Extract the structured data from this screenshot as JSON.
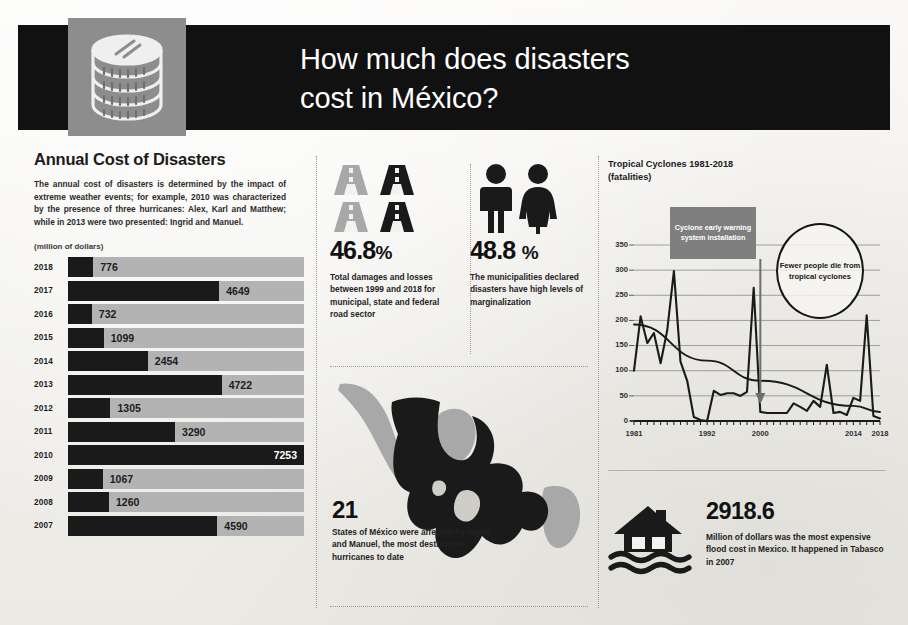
{
  "header": {
    "title_line1": "How much does disasters",
    "title_line2": "cost in México?",
    "icon": "coin-stack-icon"
  },
  "left": {
    "heading": "Annual Cost of Disasters",
    "body": "The annual cost of disasters is determined by the impact of extreme weather events; for example, 2010 was characterized by the presence of three hurricanes: Alex, Karl and Matthew; while in 2013 were two presented: Ingrid and Manuel.",
    "units": "(million of dollars)"
  },
  "middle": {
    "stat_roads": {
      "percent": "46.8",
      "symbol": "%",
      "description": "Total damages and losses between 1999 and 2018 for municipal, state and federal road sector",
      "icon": "road-icon"
    },
    "stat_people": {
      "percent": "48.8",
      "symbol": "%",
      "description": "The municipalities declared disasters have high levels of marginalization",
      "icon": "people-icon"
    },
    "map": {
      "number": "21",
      "description": "States of México were affected by Ingrid and Manuel, the most destructive hurricanes to date",
      "icon": "mexico-map-icon"
    }
  },
  "right": {
    "flood": {
      "number": "2918.6",
      "description": "Million of dollars was the most expensive flood cost in Mexico. It happened in Tabasco in 2007",
      "icon": "flooded-house-icon"
    }
  },
  "colors": {
    "ink": "#1a1a1a",
    "track_gray": "#b3b3b3",
    "callout_gray": "#7f7f7f",
    "badge_gray": "#8d8d8d",
    "paper": "#f3f2ef"
  },
  "chart_data": [
    {
      "type": "bar",
      "title": "Annual Cost of Disasters",
      "subtitle": "(million of dollars)",
      "orientation": "horizontal",
      "xlabel": "",
      "ylabel": "",
      "grid": false,
      "xlim": [
        0,
        7253
      ],
      "categories": [
        "2018",
        "2017",
        "2016",
        "2015",
        "2014",
        "2013",
        "2012",
        "2011",
        "2010",
        "2009",
        "2008",
        "2007"
      ],
      "values": [
        776,
        4649,
        732,
        1099,
        2454,
        4722,
        1305,
        3290,
        7253,
        1067,
        1260,
        4590
      ],
      "value_labels": [
        "776",
        "4649",
        "732",
        "1099",
        "2454",
        "4722",
        "1305",
        "3290",
        "7253",
        "1067",
        "1260",
        "4590"
      ],
      "label_position": [
        "outside",
        "outside",
        "outside",
        "outside",
        "outside",
        "outside",
        "outside",
        "outside",
        "inside",
        "outside",
        "outside",
        "outside"
      ]
    },
    {
      "type": "line",
      "title": "Tropical Cyclones 1981-2018",
      "subtitle": "(fatalities)",
      "xlabel": "",
      "ylabel": "",
      "grid": true,
      "ylim": [
        0,
        350
      ],
      "yticks": [
        0,
        50,
        100,
        150,
        200,
        250,
        300,
        350
      ],
      "xlim": [
        1981,
        2018
      ],
      "xticks": [
        1981,
        1992,
        2000,
        2014,
        2018
      ],
      "xtick_labels": [
        "1981",
        "1992",
        "2000",
        "2014",
        "2018"
      ],
      "legend": "none",
      "annotations": [
        {
          "name": "warning-system-callout",
          "text": "Cyclone early warning system installation",
          "points_to_year": 2000,
          "style": "gray-box-with-arrow"
        },
        {
          "name": "fewer-deaths-callout",
          "text": "Fewer people die from tropical cyclones",
          "style": "circle-outline"
        }
      ],
      "series": [
        {
          "name": "Fatalities",
          "x": [
            1981,
            1982,
            1983,
            1984,
            1985,
            1986,
            1987,
            1988,
            1989,
            1990,
            1991,
            1992,
            1993,
            1994,
            1995,
            1996,
            1997,
            1998,
            1999,
            2000,
            2001,
            2002,
            2003,
            2004,
            2005,
            2006,
            2007,
            2008,
            2009,
            2010,
            2011,
            2012,
            2013,
            2014,
            2015,
            2016,
            2017,
            2018
          ],
          "values": [
            100,
            208,
            155,
            175,
            115,
            180,
            298,
            118,
            80,
            8,
            2,
            0,
            60,
            52,
            55,
            55,
            50,
            58,
            265,
            18,
            16,
            16,
            16,
            16,
            35,
            28,
            20,
            40,
            28,
            112,
            16,
            18,
            12,
            46,
            40,
            210,
            10,
            5,
            0,
            18
          ]
        },
        {
          "name": "Trend",
          "x": [
            1981,
            1992,
            2000,
            2014,
            2018
          ],
          "values": [
            192,
            120,
            80,
            30,
            18
          ]
        }
      ]
    }
  ]
}
